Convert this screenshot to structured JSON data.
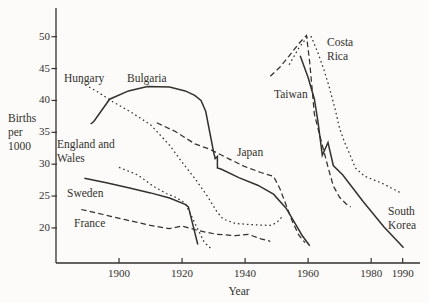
{
  "figure": {
    "background": "#fcfbf9",
    "ink_color": "#33312e"
  },
  "axes": {
    "y": {
      "title_lines": [
        "Births",
        "per",
        "1000"
      ],
      "min": 14.5,
      "max": 54.5,
      "ticks": [
        50,
        45,
        40,
        35,
        30,
        25,
        20
      ]
    },
    "x": {
      "title": "Year",
      "min": 1880,
      "max": 1995.5,
      "ticks": [
        1900,
        1920,
        1940,
        1960,
        1980,
        1990
      ]
    }
  },
  "chart_data": {
    "type": "line",
    "title": "",
    "xlabel": "Year",
    "ylabel": "Births per 1000",
    "xlim": [
      1880,
      1995.5
    ],
    "ylim": [
      14.5,
      54.5
    ],
    "grid": false,
    "legend": "inline-labels",
    "series": [
      {
        "name": "Hungary",
        "style": "dotted",
        "label_lines": [
          "Hungary"
        ],
        "label_px": {
          "x": 64,
          "y": 72
        },
        "points": [
          [
            1888,
            42.8
          ],
          [
            1893,
            41.4
          ],
          [
            1898,
            39.8
          ],
          [
            1904,
            38.1
          ],
          [
            1910,
            36.2
          ],
          [
            1916,
            33.0
          ],
          [
            1920,
            30.3
          ],
          [
            1924,
            27.8
          ],
          [
            1928,
            25.0
          ],
          [
            1931,
            22.6
          ],
          [
            1933,
            21.4
          ],
          [
            1937,
            20.7
          ],
          [
            1943,
            20.5
          ],
          [
            1948,
            20.4
          ],
          [
            1950,
            20.8
          ],
          [
            1952,
            21.9
          ]
        ]
      },
      {
        "name": "Bulgaria",
        "style": "solid",
        "label_lines": [
          "Bulgaria"
        ],
        "label_px": {
          "x": 127,
          "y": 72
        },
        "points": [
          [
            1891,
            36.3
          ],
          [
            1892,
            36.7
          ],
          [
            1897,
            40.2
          ],
          [
            1903,
            41.5
          ],
          [
            1909,
            42.2
          ],
          [
            1916,
            42.1
          ],
          [
            1921,
            41.5
          ],
          [
            1924,
            40.8
          ],
          [
            1926,
            40.0
          ],
          [
            1927.5,
            38.3
          ],
          [
            1929,
            34.5
          ],
          [
            1930,
            31.9
          ],
          [
            1930.5,
            30.9
          ],
          [
            1931.2,
            31.2
          ],
          [
            1931.2,
            29.4
          ],
          [
            1932.5,
            29.2
          ],
          [
            1938,
            27.9
          ],
          [
            1944,
            26.7
          ],
          [
            1949,
            25.3
          ],
          [
            1953,
            23.1
          ],
          [
            1956,
            20.6
          ],
          [
            1958,
            18.9
          ],
          [
            1960.5,
            17.2
          ]
        ]
      },
      {
        "name": "England and Wales",
        "style": "dotted",
        "label_lines": [
          "England and",
          "Wales"
        ],
        "label_px": {
          "x": 57,
          "y": 138
        },
        "points": [
          [
            1900,
            29.5
          ],
          [
            1906,
            28.3
          ],
          [
            1911,
            26.5
          ],
          [
            1915,
            25.4
          ],
          [
            1918,
            24.8
          ],
          [
            1921,
            23.9
          ],
          [
            1924,
            20.8
          ],
          [
            1927,
            17.8
          ],
          [
            1929.5,
            16.6
          ]
        ]
      },
      {
        "name": "Sweden",
        "style": "solid",
        "label_lines": [
          "Sweden"
        ],
        "label_px": {
          "x": 67,
          "y": 187
        },
        "points": [
          [
            1889,
            27.8
          ],
          [
            1896,
            27.1
          ],
          [
            1903,
            26.3
          ],
          [
            1910,
            25.5
          ],
          [
            1916,
            24.7
          ],
          [
            1921,
            23.7
          ],
          [
            1922,
            23.3
          ],
          [
            1925,
            17.4
          ]
        ]
      },
      {
        "name": "France",
        "style": "dashed",
        "label_lines": [
          "France"
        ],
        "label_px": {
          "x": 74,
          "y": 217
        },
        "points": [
          [
            1888,
            22.9
          ],
          [
            1895,
            22.1
          ],
          [
            1902,
            21.3
          ],
          [
            1910,
            20.4
          ],
          [
            1916,
            19.9
          ],
          [
            1920,
            20.3
          ],
          [
            1925,
            19.6
          ],
          [
            1931,
            19.0
          ],
          [
            1937,
            18.8
          ],
          [
            1941,
            19.0
          ],
          [
            1945,
            18.3
          ],
          [
            1948,
            17.9
          ]
        ]
      },
      {
        "name": "Japan",
        "style": "dashed",
        "label_lines": [
          "Japan"
        ],
        "label_px": {
          "x": 237,
          "y": 146
        },
        "points": [
          [
            1912,
            36.5
          ],
          [
            1918,
            35.1
          ],
          [
            1924,
            33.2
          ],
          [
            1929,
            32.3
          ],
          [
            1935,
            30.8
          ],
          [
            1940,
            29.6
          ],
          [
            1945,
            28.7
          ],
          [
            1949,
            28.1
          ],
          [
            1951,
            26.2
          ],
          [
            1953,
            23.6
          ],
          [
            1955,
            21.0
          ],
          [
            1957,
            18.9
          ],
          [
            1959,
            17.7
          ]
        ]
      },
      {
        "name": "Taiwan",
        "style": "dashed",
        "label_lines": [
          "Taiwan"
        ],
        "label_px": {
          "x": 274,
          "y": 88
        },
        "points": [
          [
            1948,
            43.8
          ],
          [
            1951,
            45.2
          ],
          [
            1954,
            47.0
          ],
          [
            1957,
            48.9
          ],
          [
            1959.5,
            50.2
          ],
          [
            1960.5,
            46.0
          ],
          [
            1962,
            37.8
          ],
          [
            1963.5,
            34.9
          ],
          [
            1965,
            32.0
          ],
          [
            1966.5,
            29.2
          ],
          [
            1968,
            26.6
          ],
          [
            1970,
            24.8
          ],
          [
            1972,
            23.8
          ],
          [
            1973.5,
            23.3
          ]
        ]
      },
      {
        "name": "Costa Rica",
        "style": "dotted",
        "label_lines": [
          "Costa",
          "Rica"
        ],
        "label_px": {
          "x": 327,
          "y": 36
        },
        "points": [
          [
            1954,
            45.6
          ],
          [
            1957,
            48.2
          ],
          [
            1959.5,
            49.8
          ],
          [
            1961,
            50.0
          ],
          [
            1963,
            47.6
          ],
          [
            1965,
            44.8
          ],
          [
            1966.6,
            42.3
          ],
          [
            1968.7,
            38.4
          ],
          [
            1970,
            35.6
          ],
          [
            1971.5,
            33.5
          ],
          [
            1973,
            31.8
          ],
          [
            1975,
            29.4
          ],
          [
            1978,
            28.1
          ],
          [
            1981,
            27.5
          ],
          [
            1984,
            26.9
          ],
          [
            1987,
            26.1
          ],
          [
            1989.8,
            25.4
          ]
        ]
      },
      {
        "name": "South Korea",
        "style": "solid",
        "label_lines": [
          "South",
          "Korea"
        ],
        "label_px": {
          "x": 388,
          "y": 205
        },
        "points": [
          [
            1957.5,
            47.0
          ],
          [
            1960,
            43.6
          ],
          [
            1962,
            40.2
          ],
          [
            1963.2,
            36.4
          ],
          [
            1964.5,
            31.4
          ],
          [
            1966.3,
            33.4
          ],
          [
            1968,
            29.8
          ],
          [
            1971,
            28.3
          ],
          [
            1977.5,
            24.1
          ],
          [
            1984,
            20.2
          ],
          [
            1990.3,
            16.9
          ]
        ]
      }
    ]
  }
}
